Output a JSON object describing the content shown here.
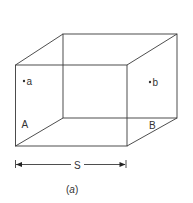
{
  "diagram": {
    "type": "box-perspective",
    "stroke_color": "#3a3a3a",
    "front_face": {
      "x1": 15.5,
      "y1": 65,
      "x2": 127,
      "y2": 146
    },
    "back_face": {
      "x1": 63,
      "y1": 34,
      "x2": 177,
      "y2": 118
    },
    "points": [
      {
        "id": "a",
        "label": "a",
        "x": 24,
        "y": 81
      },
      {
        "id": "b",
        "label": "b",
        "x": 150,
        "y": 82
      }
    ],
    "face_labels": [
      {
        "id": "A",
        "label": "A",
        "x": 22,
        "y": 128
      },
      {
        "id": "B",
        "label": "B",
        "x": 149,
        "y": 128
      }
    ],
    "dimension": {
      "label": "S",
      "x1": 15.5,
      "x2": 127,
      "y": 164
    },
    "caption_open": "(",
    "caption_var": "a",
    "caption_close": ")"
  }
}
